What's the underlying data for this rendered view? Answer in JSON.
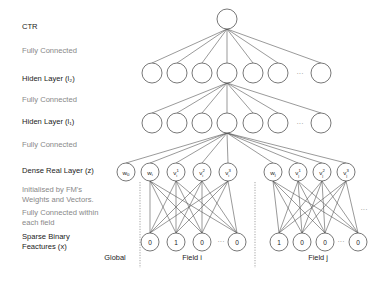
{
  "labels": {
    "ctr": "CTR",
    "fc1": "Fully Connected",
    "hidden2": "Hiden Layer (l₂)",
    "fc2": "Fully Connected",
    "hidden1": "Hiden Layer (l₁)",
    "fc3": "Fully Connected",
    "dense": "Dense Real Layer (z)",
    "init_line1": "Initialised by FM's",
    "init_line2": "Weights and Vectors.",
    "fc_field_line1": "Fully Connected within",
    "fc_field_line2": "each field",
    "sparse_line1": "Sparse Binary",
    "sparse_line2": "Feactures (x)"
  },
  "groups": {
    "global": "Global",
    "field_i": "Field i",
    "field_j": "Field j"
  },
  "ellipsis": "···",
  "dense_nodes": {
    "global": [
      {
        "base": "w",
        "sub": "0",
        "sup": ""
      }
    ],
    "field_i": [
      {
        "base": "w",
        "sub": "i",
        "sup": ""
      },
      {
        "base": "v",
        "sub": "i",
        "sup": "1"
      },
      {
        "base": "v",
        "sub": "i",
        "sup": "2"
      },
      {
        "base": "v",
        "sub": "i",
        "sup": "3"
      }
    ],
    "field_j": [
      {
        "base": "w",
        "sub": "j",
        "sup": ""
      },
      {
        "base": "v",
        "sub": "j",
        "sup": "1"
      },
      {
        "base": "v",
        "sub": "j",
        "sup": "2"
      },
      {
        "base": "v",
        "sub": "j",
        "sup": "3"
      }
    ]
  },
  "sparse_values": {
    "field_i": [
      "0",
      "1",
      "0",
      "0"
    ],
    "field_j": [
      "1",
      "0",
      "0",
      "0"
    ]
  },
  "colors": {
    "stroke": "#555555",
    "text_dark": "#222222",
    "text_light": "#888888",
    "divider": "#999999"
  }
}
